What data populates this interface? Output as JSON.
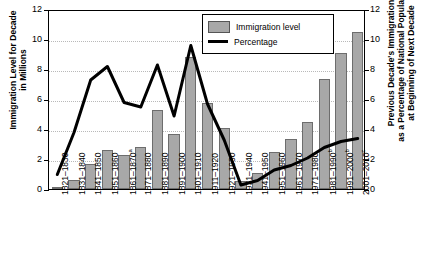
{
  "chart_data": {
    "type": "bar",
    "title": "",
    "categories": [
      "1821–1830",
      "1831–1840",
      "1841–1850",
      "1851–1860",
      "1861–1870",
      "1871–1880",
      "1881–1890",
      "1891–1900",
      "1901–1910",
      "1911–1920",
      "1921–1930",
      "1931–1940",
      "1941–1950",
      "1951–1960",
      "1961–1970",
      "1971–1980",
      "1981–1990",
      "1991–2000",
      "2001–2010"
    ],
    "category_superscripts": [
      "",
      "",
      "",
      "",
      "a",
      "",
      "",
      "",
      "",
      "",
      "",
      "",
      "",
      "",
      "",
      "",
      "b",
      "b",
      "c"
    ],
    "series": [
      {
        "name": "Immigration level",
        "type": "bar",
        "axis": "left",
        "values": [
          0.14,
          0.6,
          1.7,
          2.6,
          2.3,
          2.8,
          5.25,
          3.7,
          8.8,
          5.75,
          4.1,
          0.53,
          1.04,
          2.5,
          3.32,
          4.49,
          7.34,
          9.1,
          10.5
        ]
      },
      {
        "name": "Percentage",
        "type": "line",
        "axis": "right",
        "values": [
          1.1,
          3.9,
          7.4,
          8.3,
          5.9,
          5.6,
          8.4,
          5.0,
          9.7,
          5.8,
          3.4,
          0.4,
          0.7,
          1.4,
          1.7,
          2.2,
          2.9,
          3.3,
          3.5
        ]
      }
    ],
    "xlabel": "",
    "ylabel": "Immigration Level for Decade\nin Millions",
    "ylabel_right": "Previous Decade's Immigration\nas a Percentage of National Population\nat Beginning of Next Decade",
    "ylim": [
      0,
      12
    ],
    "ylim_right": [
      0,
      12
    ],
    "yticks": [
      0,
      2,
      4,
      6,
      8,
      10,
      12
    ],
    "yticks_right": [
      0,
      2,
      4,
      6,
      8,
      10,
      12
    ],
    "grid": true,
    "legend_position": "top-right",
    "colors": {
      "bar_fill": "#a8a8a8",
      "bar_edge": "#6d6d6d",
      "line": "#000000",
      "grid": "#b9b9b9"
    }
  },
  "legend": {
    "items": [
      {
        "label": "Immigration level",
        "marker": "bar-swatch"
      },
      {
        "label": "Percentage",
        "marker": "line-swatch"
      }
    ]
  }
}
